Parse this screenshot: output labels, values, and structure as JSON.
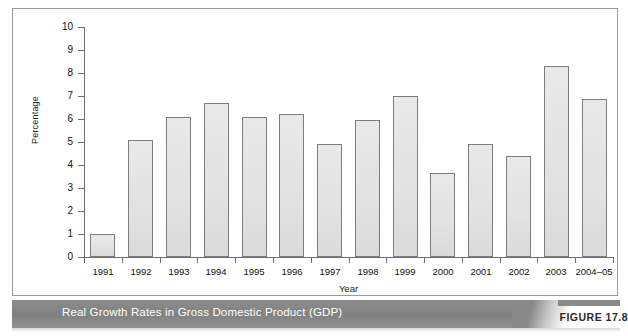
{
  "figure": {
    "caption": "Real Growth Rates in Gross Domestic Product (GDP)",
    "figure_number": "FIGURE 17.8",
    "band_color": "#878787",
    "caption_text_color": "#ffffff",
    "figure_label_color": "#2b2b2b"
  },
  "chart_data": {
    "type": "bar",
    "title": "",
    "xlabel": "Year",
    "ylabel": "Percentage",
    "ylim": [
      0,
      10
    ],
    "y_ticks": [
      0,
      1,
      2,
      3,
      4,
      5,
      6,
      7,
      8,
      9,
      10
    ],
    "grid": false,
    "legend": null,
    "bar_fill_color": "#e4e4e4",
    "bar_border_color": "#7d7d7d",
    "categories": [
      "1991",
      "1992",
      "1993",
      "1994",
      "1995",
      "1996",
      "1997",
      "1998",
      "1999",
      "2000",
      "2001",
      "2002",
      "2003",
      "2004–05"
    ],
    "values": [
      1.0,
      5.1,
      6.1,
      6.7,
      6.1,
      6.2,
      4.9,
      5.95,
      7.0,
      3.65,
      4.9,
      4.4,
      8.3,
      6.85
    ]
  }
}
